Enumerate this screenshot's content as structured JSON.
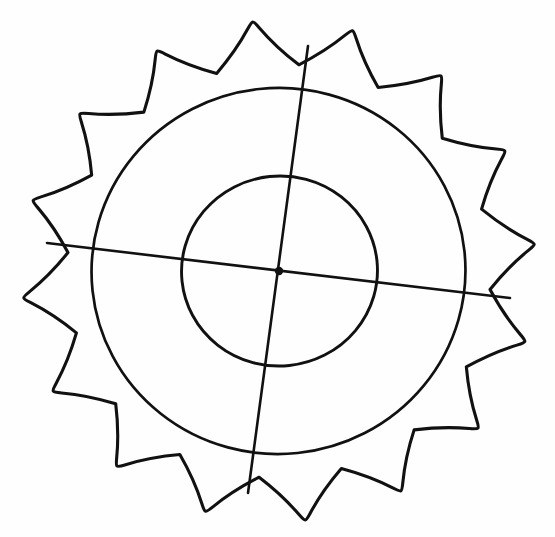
{
  "canvas": {
    "width": 555,
    "height": 537,
    "background_color": "#fefefe",
    "ink_color": "#111111",
    "title": "Scalloped rosette line drawing with two concentric circles and crossed diameters"
  },
  "figure": {
    "name": "scalloped-rosette-diagram",
    "style": "hand-drawn black line art on white, no fill",
    "elements": [
      {
        "name": "scalloped-outer-outline",
        "label": "Scalloped petal outline",
        "petal_count": 16
      },
      {
        "name": "middle-circle",
        "label": "Middle circle"
      },
      {
        "name": "inner-circle",
        "label": "Inner circle"
      },
      {
        "name": "vertical-diameter",
        "label": "Vertical diameter line"
      },
      {
        "name": "horizontal-diameter",
        "label": "Horizontal diameter line"
      },
      {
        "name": "center-dot",
        "label": "Center point dot"
      }
    ]
  },
  "geometry": {
    "center": {
      "x": 279,
      "y": 271
    },
    "center_dot_radius": 4.2,
    "inner_circle": {
      "cx": 279.5,
      "cy": 271,
      "rx": 98,
      "ry": 95,
      "rotation_deg": -6
    },
    "middle_circle": {
      "cx": 278.5,
      "cy": 271,
      "rx": 187,
      "ry": 183,
      "rotation_deg": -6
    },
    "scallop": {
      "petal_count": 16,
      "outer_radius_x": 248,
      "outer_radius_y": 242,
      "valley_radius_x": 212,
      "valley_radius_y": 207,
      "rotation_deg": -6,
      "bulge": 1.62
    },
    "vertical_line": {
      "top": {
        "x": 308,
        "y": 46
      },
      "bottom": {
        "x": 248,
        "y": 493
      }
    },
    "horizontal_line": {
      "left": {
        "x": 47,
        "y": 243
      },
      "right": {
        "x": 510,
        "y": 298
      }
    }
  },
  "chart_data": {
    "type": "scatter",
    "title": "Scalloped rosette line drawing",
    "xlabel": "",
    "ylabel": "",
    "xlim": [
      0,
      555
    ],
    "ylim": [
      0,
      537
    ],
    "grid": false,
    "legend": "none",
    "annotations": [],
    "series": [
      {
        "name": "center-point",
        "values": [
          {
            "x": 279,
            "y": 271
          }
        ]
      },
      {
        "name": "inner-circle-axis-intersections",
        "values": [
          {
            "x": 181,
            "y": 262
          },
          {
            "x": 378,
            "y": 281
          },
          {
            "x": 289,
            "y": 176
          },
          {
            "x": 266,
            "y": 366
          }
        ]
      },
      {
        "name": "middle-circle-axis-intersections",
        "values": [
          {
            "x": 91,
            "y": 250
          },
          {
            "x": 466,
            "y": 292
          },
          {
            "x": 300,
            "y": 88
          },
          {
            "x": 256,
            "y": 454
          }
        ]
      },
      {
        "name": "scallop-valley-on-axes",
        "values": [
          {
            "x": 47,
            "y": 243
          },
          {
            "x": 510,
            "y": 298
          },
          {
            "x": 308,
            "y": 46
          },
          {
            "x": 248,
            "y": 493
          }
        ]
      }
    ]
  }
}
